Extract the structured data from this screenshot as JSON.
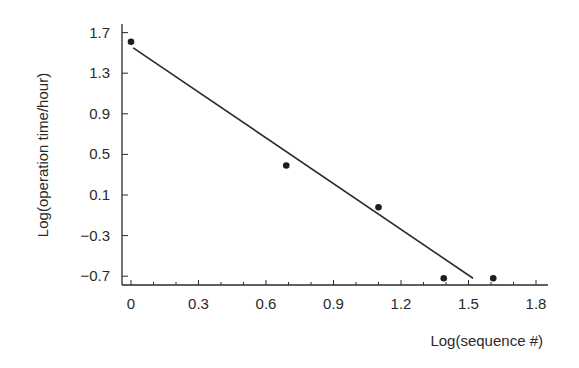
{
  "chart_data": {
    "type": "scatter",
    "title": "",
    "xlabel": "Log(sequence #)",
    "ylabel": "Log(operation time/hour)",
    "xlim": [
      -0.05,
      1.9
    ],
    "ylim": [
      -0.75,
      1.75
    ],
    "grid": false,
    "legend": null,
    "x_ticks": [
      "0",
      "0.3",
      "0.6",
      "0.9",
      "1.2",
      "1.5",
      "1.8"
    ],
    "y_ticks": [
      "1.7",
      "1.3",
      "0.9",
      "0.5",
      "0.1",
      "−0.3",
      "−0.7"
    ],
    "series": [
      {
        "name": "observations",
        "kind": "scatter",
        "x": [
          0.0,
          0.69,
          1.1,
          1.39,
          1.61
        ],
        "y": [
          1.61,
          0.39,
          -0.02,
          -0.72,
          -0.72
        ]
      },
      {
        "name": "fitted line",
        "kind": "line",
        "x": [
          0.01,
          1.52
        ],
        "y": [
          1.55,
          -0.72
        ]
      }
    ]
  }
}
